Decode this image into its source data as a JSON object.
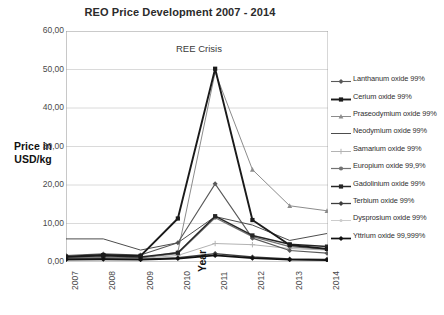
{
  "chart_data": {
    "type": "line",
    "title": "REO Price Development 2007 - 2014",
    "xlabel": "Year",
    "ylabel": "Price in USD/kg",
    "ylabel_line1": "Price in",
    "ylabel_line2": "USD/kg",
    "grid": true,
    "legend_position": "right",
    "annotations": [
      {
        "text": "REE Crisis",
        "x": "2011",
        "y": 56
      }
    ],
    "categories": [
      "2007",
      "2008",
      "2009",
      "2010",
      "2011",
      "2012",
      "2013",
      "2014"
    ],
    "x": [
      "2007",
      "2008",
      "2009",
      "2010",
      "2011",
      "2012",
      "2013",
      "2014"
    ],
    "ylim": [
      0,
      60
    ],
    "ytick_labels": [
      "0,00",
      "10,00",
      "20,00",
      "30,00",
      "40,00",
      "50,00",
      "60,00"
    ],
    "ytick_values": [
      0,
      10,
      20,
      30,
      40,
      50,
      60
    ],
    "series": [
      {
        "name": "Lanthanum oxide 99%",
        "color": "#595959",
        "marker": "diamond",
        "width": 1.1,
        "values": [
          1.7,
          2.1,
          1.8,
          5.0,
          20.3,
          6.2,
          3.0,
          2.3
        ]
      },
      {
        "name": "Cerium oxide 99%",
        "color": "#1a1a1a",
        "marker": "square",
        "width": 1.9,
        "values": [
          1.4,
          1.8,
          1.6,
          11.3,
          50.2,
          10.9,
          4.4,
          3.4
        ]
      },
      {
        "name": "Praseodymium oxide 99%",
        "color": "#8c8c8c",
        "marker": "triangle",
        "width": 1.0,
        "values": [
          1.0,
          1.2,
          1.0,
          2.6,
          49.3,
          24.0,
          14.6,
          13.3
        ]
      },
      {
        "name": "Neodymium oxide 99%",
        "color": "#4d4d4d",
        "marker": "none",
        "width": 1.0,
        "values": [
          6.0,
          6.0,
          3.1,
          5.0,
          11.8,
          9.6,
          5.6,
          7.4
        ]
      },
      {
        "name": "Samarium oxide 99%",
        "color": "#b3b3b3",
        "marker": "plus",
        "width": 1.0,
        "values": [
          0.9,
          1.0,
          0.9,
          1.7,
          4.8,
          4.5,
          3.5,
          3.1
        ]
      },
      {
        "name": "Europium oxide 99,9%",
        "color": "#737373",
        "marker": "circle",
        "width": 1.2,
        "values": [
          1.1,
          1.3,
          1.1,
          2.2,
          11.5,
          6.6,
          4.0,
          3.3
        ]
      },
      {
        "name": "Gadolinium oxide 99%",
        "color": "#262626",
        "marker": "square",
        "width": 1.5,
        "values": [
          1.3,
          1.6,
          1.3,
          2.4,
          11.9,
          6.9,
          4.6,
          4.0
        ]
      },
      {
        "name": "Terbium oxide 99%",
        "color": "#3d3d3d",
        "marker": "diamond",
        "width": 1.3,
        "values": [
          0.8,
          0.9,
          0.7,
          1.1,
          2.2,
          1.3,
          0.8,
          0.7
        ]
      },
      {
        "name": "Dysprosium oxide 99%",
        "color": "#cccccc",
        "marker": "dot",
        "width": 1.0,
        "values": [
          0.7,
          0.8,
          0.7,
          1.0,
          1.9,
          1.1,
          0.7,
          0.6
        ]
      },
      {
        "name": "Yttrium oxide 99,999%",
        "color": "#111111",
        "marker": "diamond",
        "width": 1.7,
        "values": [
          0.6,
          0.7,
          0.6,
          0.9,
          1.7,
          1.0,
          0.6,
          0.5
        ]
      }
    ]
  }
}
